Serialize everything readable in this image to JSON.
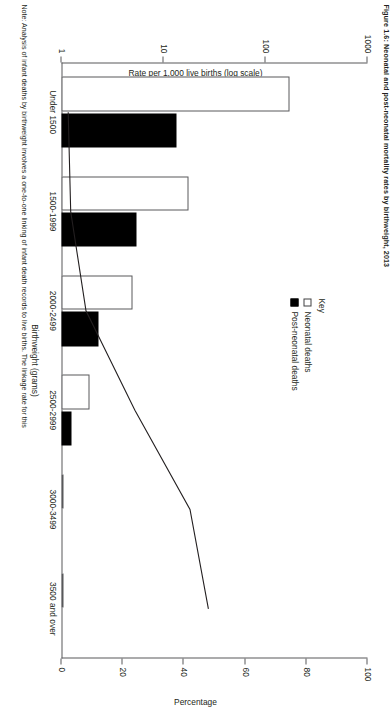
{
  "figure": {
    "caption": "Figure 1.6:  Neonatal and post-neonatal mortality rates by birthweight, 2013",
    "note": "Note: Analysis of infant deaths by birthweight involves a one-to-one linking of infant death records to live births. The linkage rate for this"
  },
  "key": {
    "title": "Key",
    "items": [
      {
        "label": "Neonatal deaths",
        "swatch": "white",
        "color": "#ffffff"
      },
      {
        "label": "Post-neonatal deaths",
        "swatch": "black",
        "color": "#000000"
      }
    ]
  },
  "chart_data": {
    "type": "bar",
    "title": "Neonatal and post-neonatal mortality rates by birthweight",
    "xlabel": "Birthweight (grams)",
    "ylabel": "Rate per 1,000 live births (log scale)",
    "y2label": "Percentage",
    "categories": [
      "Under 1500",
      "1500-1999",
      "2000-2499",
      "2500-2999",
      "3000-3499",
      "3500 and over"
    ],
    "yscale": "log",
    "ylim": [
      1,
      1000
    ],
    "yticks": [
      1,
      10,
      100,
      1000
    ],
    "yticklabels": [
      "1",
      "10",
      "100",
      "1000"
    ],
    "ylim2": [
      0,
      100
    ],
    "yticks2": [
      0,
      20,
      40,
      60,
      80,
      100
    ],
    "yticklabels2": [
      "0",
      "20",
      "40",
      "60",
      "80",
      "100"
    ],
    "grid": false,
    "legend_position": "inside-top-center",
    "series": [
      {
        "name": "Neonatal deaths",
        "axis": "left",
        "color": "#ffffff",
        "values": [
          172.0,
          17.5,
          5.0,
          1.9,
          1.05,
          0.95
        ]
      },
      {
        "name": "Post-neonatal deaths",
        "axis": "left",
        "color": "#000000",
        "values": [
          13.5,
          5.4,
          2.3,
          1.25,
          0.85,
          0.72
        ]
      },
      {
        "name": "Percentage",
        "axis": "right",
        "color": "#231f20",
        "values": [
          2.2,
          3.0,
          8.0,
          24.0,
          42.0,
          48.0
        ]
      }
    ]
  }
}
